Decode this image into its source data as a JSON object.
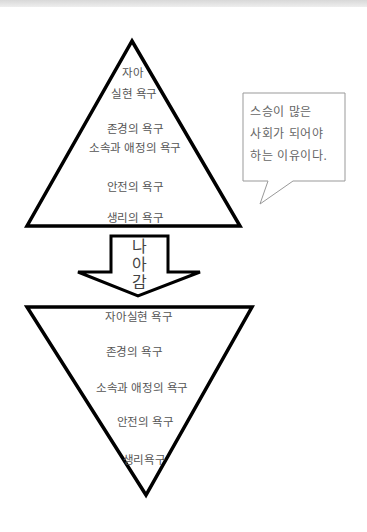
{
  "upper_pyramid": {
    "labels": [
      {
        "text": "자아",
        "x": 133,
        "y": 66
      },
      {
        "text": "실현 욕구",
        "x": 134,
        "y": 87
      },
      {
        "text": "존경의 욕구",
        "x": 135,
        "y": 122
      },
      {
        "text": "소속과 애정의 욕구",
        "x": 135,
        "y": 141
      },
      {
        "text": "안전의 욕구",
        "x": 135,
        "y": 180
      },
      {
        "text": "생리의 욕구",
        "x": 135,
        "y": 211
      }
    ]
  },
  "arrow": {
    "label_chars": [
      "나",
      "아",
      "감"
    ]
  },
  "lower_pyramid": {
    "labels": [
      {
        "text": "자아실현 욕구",
        "x": 139,
        "y": 310
      },
      {
        "text": "존경의 욕구",
        "x": 134,
        "y": 345
      },
      {
        "text": "소속과 애정의 욕구",
        "x": 142,
        "y": 381
      },
      {
        "text": "안전의 욕구",
        "x": 145,
        "y": 415
      },
      {
        "text": "생리욕구",
        "x": 144,
        "y": 453
      }
    ]
  },
  "callout": {
    "lines": [
      "스승이 많은",
      "사회가 되어야",
      "하는 이유이다."
    ]
  },
  "colors": {
    "stroke": "#000000",
    "text": "#555555",
    "callout_border": "#999999"
  }
}
